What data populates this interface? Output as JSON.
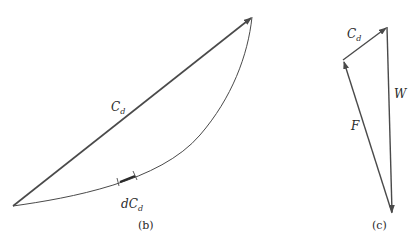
{
  "panel_b": {
    "chord_label": "C",
    "chord_label_sub": "d",
    "element_label": "dC",
    "element_label_sub": "d",
    "caption": "(b)"
  },
  "panel_c": {
    "cd_label": "C",
    "cd_label_sub": "d",
    "w_label": "W",
    "f_label": "F",
    "caption": "(c)"
  },
  "colors": {
    "line": "#4a4a4a",
    "text": "#2a2a2a",
    "background": "#ffffff"
  }
}
